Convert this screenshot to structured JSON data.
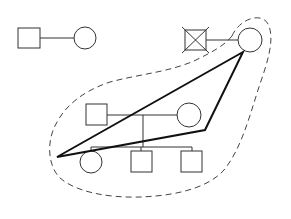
{
  "diagram": {
    "type": "genogram",
    "colors": {
      "background": "#ffffff",
      "stroke": "#333333",
      "bold_stroke": "#111111",
      "boundary": "#444444"
    },
    "nodes": [
      {
        "id": "m1",
        "shape": "square",
        "sex": "male",
        "x": 18,
        "y": 28,
        "size": 22,
        "deceased": false
      },
      {
        "id": "f1",
        "shape": "circle",
        "sex": "female",
        "cx": 85,
        "cy": 38,
        "r": 11,
        "deceased": false
      },
      {
        "id": "m2",
        "shape": "square",
        "sex": "male",
        "x": 185,
        "y": 30,
        "size": 21,
        "deceased": true
      },
      {
        "id": "f2",
        "shape": "circle",
        "sex": "female",
        "cx": 250,
        "cy": 40,
        "r": 12,
        "deceased": false
      },
      {
        "id": "m3",
        "shape": "square",
        "sex": "male",
        "x": 86,
        "y": 104,
        "size": 21,
        "deceased": false
      },
      {
        "id": "f3",
        "shape": "circle",
        "sex": "female",
        "cx": 189,
        "cy": 115,
        "r": 12,
        "deceased": false
      },
      {
        "id": "c1",
        "shape": "circle",
        "sex": "female",
        "cx": 91,
        "cy": 162,
        "r": 11,
        "deceased": false
      },
      {
        "id": "c2",
        "shape": "square",
        "sex": "male",
        "x": 131,
        "y": 151,
        "size": 21,
        "deceased": false
      },
      {
        "id": "c3",
        "shape": "square",
        "sex": "male",
        "x": 181,
        "y": 151,
        "size": 21,
        "deceased": false
      }
    ],
    "relationships": [
      {
        "type": "marriage",
        "from": "m1",
        "to": "f1"
      },
      {
        "type": "marriage",
        "from": "m2",
        "to": "f2"
      },
      {
        "type": "marriage",
        "from": "m3",
        "to": "f3"
      },
      {
        "type": "children",
        "parents": [
          "m3",
          "f3"
        ],
        "children": [
          "c1",
          "c2",
          "c3"
        ]
      }
    ],
    "triangle": {
      "points": [
        [
          243,
          52
        ],
        [
          57,
          157
        ],
        [
          205,
          130
        ]
      ]
    },
    "boundary": {
      "style": "dashed",
      "encloses": [
        "f2",
        "m3",
        "f3",
        "c1",
        "c2",
        "c3"
      ]
    }
  }
}
